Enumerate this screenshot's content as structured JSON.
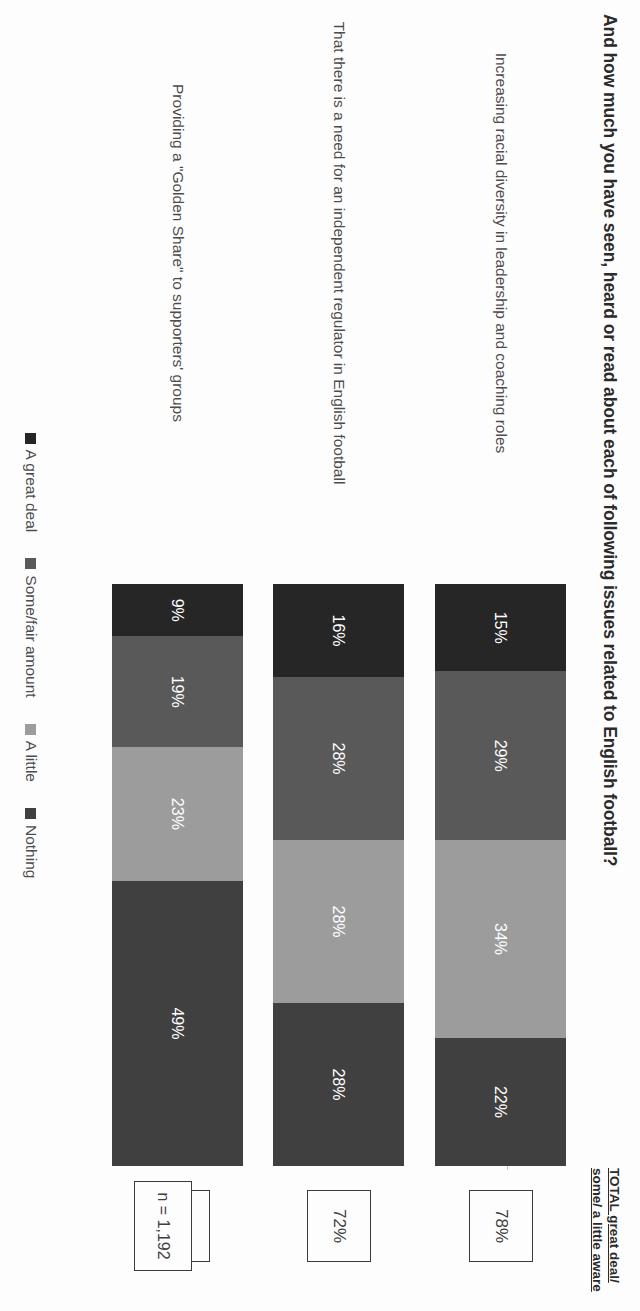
{
  "header": {
    "title": "And how much you have seen, heard or read about each of following issues related to English football?",
    "total_column_header": "TOTAL great deal/ some/ a little aware",
    "sample_size": "n = 1,192"
  },
  "legend": {
    "items": [
      {
        "label": "A great deal",
        "color": "#262626"
      },
      {
        "label": "Some/fair amount",
        "color": "#595959"
      },
      {
        "label": "A little",
        "color": "#9c9c9c"
      },
      {
        "label": "Nothing",
        "color": "#404040"
      }
    ]
  },
  "chart_data": {
    "type": "bar",
    "subtype": "stacked-bar-horizontal-100",
    "title": "And how much you have seen, heard or read about each of following issues related to English football?",
    "xlabel": "",
    "ylabel": "",
    "xlim": [
      0,
      100
    ],
    "grid": false,
    "legend_position": "bottom",
    "orientation": "horizontal",
    "categories": [
      "Increasing racial diversity in leadership and coaching roles",
      "That there is a need for an independent regulator in English football",
      "Providing a \"Golden Share\" to supporters' groups"
    ],
    "series": [
      {
        "name": "A great deal",
        "color": "#262626",
        "values": [
          15,
          16,
          9
        ]
      },
      {
        "name": "Some/fair amount",
        "color": "#595959",
        "values": [
          29,
          28,
          19
        ]
      },
      {
        "name": "A little",
        "color": "#9c9c9c",
        "values": [
          34,
          28,
          23
        ]
      },
      {
        "name": "Nothing",
        "color": "#404040",
        "values": [
          22,
          28,
          49
        ]
      }
    ],
    "totals_aware": [
      "78%",
      "72%",
      "51%"
    ],
    "value_labels": [
      [
        "15%",
        "29%",
        "34%",
        "22%"
      ],
      [
        "16%",
        "28%",
        "28%",
        "28%"
      ],
      [
        "9%",
        "19%",
        "23%",
        "49%"
      ]
    ],
    "sample_size_label": "n = 1,192"
  }
}
